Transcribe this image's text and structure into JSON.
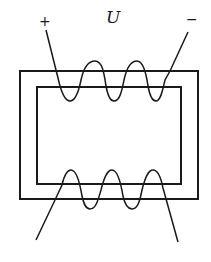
{
  "diagram": {
    "type": "transformer-core-with-windings",
    "labels": {
      "voltage": "U",
      "positive_terminal": "+",
      "negative_terminal": "−"
    },
    "core": {
      "outer": {
        "x": 20,
        "y": 71,
        "width": 178,
        "height": 128
      },
      "inner": {
        "x": 37,
        "y": 87,
        "width": 144,
        "height": 97
      }
    },
    "windings": {
      "top": {
        "turns": 3,
        "limb": "top",
        "terminals": [
          "+",
          "−"
        ]
      },
      "bottom": {
        "turns": 3,
        "limb": "bottom",
        "terminals": []
      }
    },
    "colors": {
      "stroke": "#1a1a1a",
      "background": "#ffffff"
    }
  }
}
